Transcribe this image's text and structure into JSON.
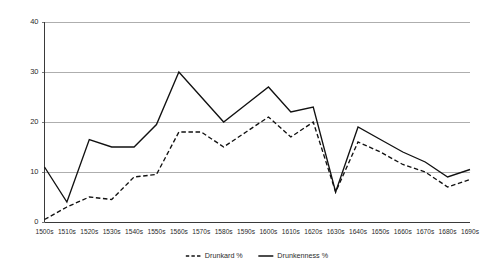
{
  "chart_data": {
    "type": "line",
    "title": "",
    "subtitle": "",
    "xlabel": "",
    "ylabel": "",
    "ylim": [
      0,
      40
    ],
    "y_ticks": [
      0,
      10,
      20,
      30,
      40
    ],
    "grid": true,
    "legend_position": "bottom",
    "categories": [
      "1500s",
      "1510s",
      "1520s",
      "1530s",
      "1540s",
      "1550s",
      "1560s",
      "1570s",
      "1580s",
      "1590s",
      "1600s",
      "1610s",
      "1620s",
      "1630s",
      "1640s",
      "1650s",
      "1660s",
      "1670s",
      "1680s",
      "1690s"
    ],
    "series": [
      {
        "name": "Drunkard %",
        "style": "dashed",
        "color": "#111111",
        "values": [
          0.5,
          3,
          5,
          4.5,
          9,
          9.5,
          18,
          18,
          15,
          18,
          21,
          17,
          20,
          6,
          16,
          14,
          11.5,
          10,
          7,
          8.5
        ]
      },
      {
        "name": "Drunkenness %",
        "style": "solid",
        "color": "#111111",
        "values": [
          11,
          4,
          16.5,
          15,
          15,
          19.5,
          30,
          25,
          20,
          23.5,
          27,
          22,
          23,
          6,
          19,
          16.5,
          14,
          12,
          9,
          10.5
        ]
      }
    ]
  },
  "legend": {
    "items": [
      {
        "label": "Drunkard %",
        "style": "dashed"
      },
      {
        "label": "Drunkenness %",
        "style": "solid"
      }
    ]
  },
  "axes": {
    "y_tick_labels": [
      "0",
      "10",
      "20",
      "30",
      "40"
    ],
    "x_tick_labels": [
      "1500s",
      "1510s",
      "1520s",
      "1530s",
      "1540s",
      "1550s",
      "1560s",
      "1570s",
      "1580s",
      "1590s",
      "1600s",
      "1610s",
      "1620s",
      "1630s",
      "1640s",
      "1650s",
      "1660s",
      "1670s",
      "1680s",
      "1690s"
    ]
  },
  "colors": {
    "grid": "#9a9a9a",
    "axis": "#3a3a3a",
    "series": "#111111",
    "background": "#ffffff"
  }
}
